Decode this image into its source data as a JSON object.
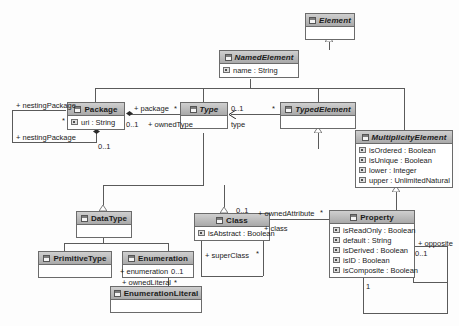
{
  "diagram": {
    "classes": [
      {
        "id": "element",
        "name": "Element",
        "abstract": true,
        "attributes": []
      },
      {
        "id": "namedelement",
        "name": "NamedElement",
        "abstract": true,
        "attributes": [
          "name : String"
        ]
      },
      {
        "id": "package",
        "name": "Package",
        "abstract": false,
        "attributes": [
          "uri : String"
        ]
      },
      {
        "id": "type",
        "name": "Type",
        "abstract": true,
        "attributes": []
      },
      {
        "id": "typedelement",
        "name": "TypedElement",
        "abstract": true,
        "attributes": []
      },
      {
        "id": "multiplicityelement",
        "name": "MultiplicityElement",
        "abstract": true,
        "attributes": [
          "isOrdered : Boolean",
          "isUnique : Boolean",
          "lower : Integer",
          "upper : UnlimitedNatural"
        ]
      },
      {
        "id": "datatype",
        "name": "DataType",
        "abstract": false,
        "attributes": []
      },
      {
        "id": "class",
        "name": "Class",
        "abstract": false,
        "attributes": [
          "isAbstract : Boolean"
        ]
      },
      {
        "id": "property",
        "name": "Property",
        "abstract": false,
        "attributes": [
          "isReadOnly : Boolean",
          "default : String",
          "isDerived : Boolean",
          "isID : Boolean",
          "isComposite : Boolean"
        ]
      },
      {
        "id": "primitivetype",
        "name": "PrimitiveType",
        "abstract": false,
        "attributes": []
      },
      {
        "id": "enumeration",
        "name": "Enumeration",
        "abstract": false,
        "attributes": []
      },
      {
        "id": "enumerationliteral",
        "name": "EnumerationLiteral",
        "abstract": false,
        "attributes": []
      }
    ],
    "association_labels": {
      "nesting_package_role_left": "+ nestingPackage",
      "nesting_package_mult_left": "*",
      "nesting_package_role_bottom": "+ nestingPackage",
      "nesting_package_mult_bottom": "0..1",
      "package_role": "+ package",
      "package_mult": "0..1",
      "owned_type_role": "+ ownedType",
      "owned_type_mult": "*",
      "type_role": "type",
      "type_mult": "0..1",
      "typed_element_mult": "*",
      "owned_attribute_role": "+ ownedAttribute",
      "owned_attribute_mult": "*",
      "class_role": "+ class",
      "class_mult": "0..1",
      "super_class_role": "+ superClass",
      "super_class_mult": "*",
      "enumeration_role": "+ enumeration",
      "enumeration_mult": "0..1",
      "owned_literal_role": "+ ownedLiteral",
      "owned_literal_mult": "*",
      "opposite_role": "+ opposite",
      "opposite_mult": "0..1",
      "property_mult_one": "1"
    }
  }
}
